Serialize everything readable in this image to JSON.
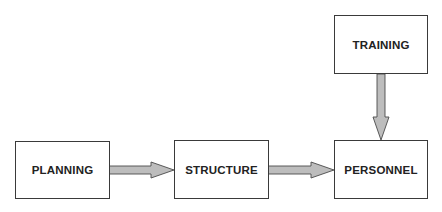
{
  "diagram": {
    "type": "flowchart",
    "nodes": [
      {
        "id": "planning",
        "label": "PLANNING"
      },
      {
        "id": "structure",
        "label": "STRUCTURE"
      },
      {
        "id": "personnel",
        "label": "PERSONNEL"
      },
      {
        "id": "training",
        "label": "TRAINING"
      }
    ],
    "edges": [
      {
        "from": "planning",
        "to": "structure"
      },
      {
        "from": "structure",
        "to": "personnel"
      },
      {
        "from": "training",
        "to": "personnel"
      }
    ],
    "colors": {
      "arrow_fill": "#bdbdbd",
      "arrow_stroke": "#4a4a4a",
      "box_border": "#3a3a3a",
      "text": "#222222"
    }
  }
}
